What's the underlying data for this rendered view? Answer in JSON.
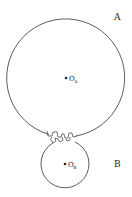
{
  "diagram": {
    "gear_a": {
      "label": "A",
      "center_label": "O",
      "center_sub": "A",
      "cx": 66,
      "cy": 78,
      "r": 59
    },
    "gear_b": {
      "label": "B",
      "center_label": "O",
      "center_sub": "B",
      "cx": 65,
      "cy": 164,
      "r": 24
    },
    "colors": {
      "stroke": "#333333",
      "text": "#222222",
      "background": "#ffffff"
    }
  }
}
